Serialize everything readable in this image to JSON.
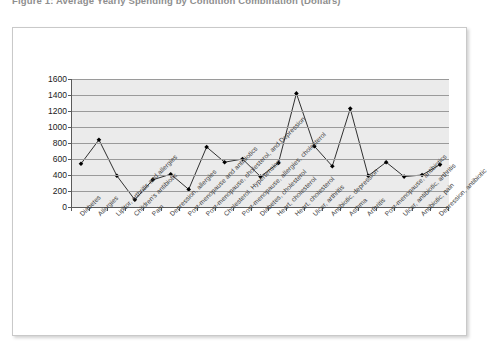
{
  "figure": {
    "caption": "Figure 1: Average Yearly Spending by Condition Combination (Dollars)"
  },
  "chart_data": {
    "type": "line",
    "title": "",
    "xlabel": "",
    "ylabel": "",
    "ylim": [
      0,
      1600
    ],
    "ytick_step": 200,
    "grid": true,
    "legend": "none",
    "marker": "filled-diamond",
    "line_color": "#000000",
    "marker_color": "#000000",
    "plot_background": "#ebebeb",
    "categories": [
      "Diabetes",
      "Allergies",
      "Lipitor, arthritis and allergies",
      "Children's antibiotic",
      "Pain",
      "Depression, allergies",
      "Post-menopause and antibiotics",
      "Post-menopause, cholesterol, and Depression",
      "Cholesterol, Hypertension",
      "Post-menopause, allergies, cholesterol",
      "Diabetes, cholesterol",
      "Heart, cholesterol",
      "Heart, cholesterol",
      "Ulcer, arthritis",
      "Antibiotic, depression",
      "Asthma",
      "Arthritis",
      "Post-menopause, antibiotics",
      "Ulcer, antibiotic, arthritis",
      "Antibiotic, pain",
      "Depression, antibiotic"
    ],
    "values": [
      540,
      840,
      390,
      90,
      340,
      410,
      220,
      750,
      560,
      600,
      380,
      550,
      1420,
      760,
      510,
      1230,
      390,
      560,
      380,
      400,
      530
    ],
    "ytick_labels": [
      "0",
      "200",
      "400",
      "600",
      "800",
      "1000",
      "1200",
      "1400",
      "1600"
    ]
  }
}
